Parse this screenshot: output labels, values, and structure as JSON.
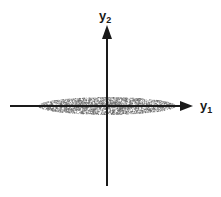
{
  "figure": {
    "type": "scatter-cloud-diagram",
    "background_color": "#ffffff",
    "width": 221,
    "height": 197
  },
  "axes": {
    "vertical": {
      "name": "y2",
      "label_main": "y",
      "label_sub": "2",
      "color": "#1a1a1a",
      "x": 107,
      "top_y": 25,
      "bottom_y": 186,
      "arrow": "up"
    },
    "horizontal": {
      "name": "y1",
      "label_main": "y",
      "label_sub": "1",
      "color": "#1a1a1a",
      "y": 106,
      "left_x": 10,
      "right_x": 193,
      "arrow": "right"
    }
  },
  "chart_data": {
    "type": "scatter",
    "title": "",
    "xlabel": "y1",
    "ylabel": "y2",
    "origin": {
      "x": 107,
      "y": 106
    },
    "cloud": {
      "center_x": 107,
      "center_y": 106,
      "semi_axis_x": 69,
      "semi_axis_y": 9,
      "left_extent_x": 38,
      "right_extent_x": 176,
      "top_extent_y": 97,
      "bottom_extent_y": 115,
      "point_count": 2400,
      "point_color": "#6b6b6b",
      "point_radius": 0.62,
      "fill_appearance": "stippled-gray"
    },
    "grid": false,
    "legend": null,
    "xlim": [
      -1,
      1
    ],
    "ylim": [
      -1,
      1
    ]
  }
}
